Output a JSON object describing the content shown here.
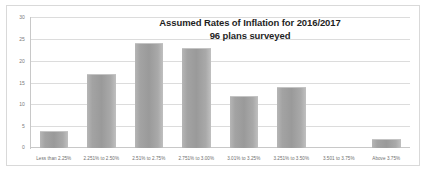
{
  "chart_data": {
    "type": "bar",
    "title": "Assumed Rates of Inflation for 2016/2017",
    "subtitle": "96 plans surveyed",
    "xlabel": "",
    "ylabel": "",
    "ylim": [
      0,
      30
    ],
    "yticks": [
      0,
      5,
      10,
      15,
      20,
      25,
      30
    ],
    "ytick_labels": [
      "0",
      "5",
      "10",
      "15",
      "20",
      "25",
      "30"
    ],
    "grid": true,
    "legend": false,
    "categories": [
      "Less than 2.25%",
      "2.251% to 2.50%",
      "2.51% to 2.75%",
      "2.751% to 3.00%",
      "3.01% to 3.25%",
      "3.251% to 3.50%",
      "3.501 to 3.75%",
      "Above 3.75%"
    ],
    "values": [
      4,
      17,
      24,
      23,
      12,
      14,
      0,
      2
    ],
    "bar_color": "#9e9e9e",
    "gridline_color": "#dcdcdc",
    "axis_text_color": "#7a7a7a",
    "title_color": "#1f1f1f",
    "plot_background": "#ffffff",
    "border_color": "#d9d9d9"
  }
}
